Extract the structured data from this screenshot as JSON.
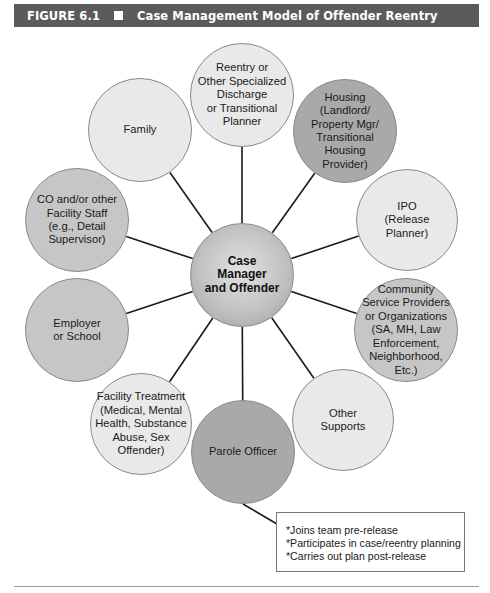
{
  "figure": {
    "number": "FIGURE 6.1",
    "title": "Case Management Model of Offender Reentry"
  },
  "diagram": {
    "center": {
      "label": "Case\nManager\nand Offender",
      "x": 242,
      "y": 275,
      "r": 52
    },
    "nodes": [
      {
        "id": "reentry-planner",
        "label": "Reentry or\nOther Specialized\nDischarge\nor Transitional\nPlanner",
        "x": 242,
        "y": 95,
        "r": 52,
        "shade": "light"
      },
      {
        "id": "housing",
        "label": "Housing\n(Landlord/\nProperty Mgr/\nTransitional\nHousing\nProvider)",
        "x": 345,
        "y": 131,
        "r": 52,
        "shade": "dark"
      },
      {
        "id": "ipo",
        "label": "IPO\n(Release\nPlanner)",
        "x": 407,
        "y": 220,
        "r": 51,
        "shade": "light"
      },
      {
        "id": "community-service",
        "label": "Community\nService Providers\nor Organizations\n(SA, MH, Law\nEnforcement,\nNeighborhood,\nEtc.)",
        "x": 406,
        "y": 330,
        "r": 52,
        "shade": "mid"
      },
      {
        "id": "other-supports",
        "label": "Other\nSupports",
        "x": 343,
        "y": 420,
        "r": 51,
        "shade": "light"
      },
      {
        "id": "parole-officer",
        "label": "Parole Officer",
        "x": 243,
        "y": 452,
        "r": 52,
        "shade": "dark"
      },
      {
        "id": "facility-treatment",
        "label": "Facility Treatment\n(Medical, Mental\nHealth, Substance\nAbuse, Sex\nOffender)",
        "x": 141,
        "y": 424,
        "r": 51,
        "shade": "light"
      },
      {
        "id": "employer-school",
        "label": "Employer\nor School",
        "x": 77,
        "y": 330,
        "r": 52,
        "shade": "mid"
      },
      {
        "id": "co-facility-staff",
        "label": "CO and/or other\nFacility Staff\n(e.g., Detail\nSupervisor)",
        "x": 77,
        "y": 220,
        "r": 52,
        "shade": "mid"
      },
      {
        "id": "family",
        "label": "Family",
        "x": 140,
        "y": 130,
        "r": 52,
        "shade": "light"
      }
    ],
    "callout": {
      "attached_to": "parole-officer",
      "lines": [
        "*Joins team pre-release",
        "*Participates in case/reentry planning",
        "*Carries out plan post-release"
      ]
    }
  },
  "colors": {
    "header_bg": "#5b5b5b",
    "header_text": "#ffffff",
    "light": "#e9e9e9",
    "mid": "#c6c6c6",
    "dark": "#a9a9a9",
    "link": "#1a1a1a"
  }
}
